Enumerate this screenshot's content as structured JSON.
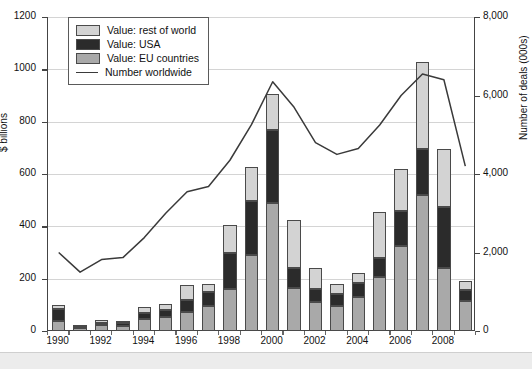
{
  "chart_data": {
    "type": "bar",
    "title": "",
    "subtitle": "",
    "xlabel": "",
    "ylabel": "$ billions",
    "y2label": "Number of deals (000s)",
    "ylim": [
      0,
      1200
    ],
    "y2lim": [
      0,
      8000
    ],
    "yticks": [
      "0",
      "200",
      "400",
      "600",
      "800",
      "1000",
      "1200"
    ],
    "ytick_values": [
      0,
      200,
      400,
      600,
      800,
      1000,
      1200
    ],
    "y2ticks": [
      "0",
      "2,000",
      "4,000",
      "6,000",
      "8,000"
    ],
    "y2tick_values": [
      0,
      2000,
      4000,
      6000,
      8000
    ],
    "grid": true,
    "legend_position": "top-left",
    "stacked": true,
    "categories": [
      "1990",
      "1991",
      "1992",
      "1993",
      "1994",
      "1995",
      "1996",
      "1997",
      "1998",
      "1999",
      "2000",
      "2001",
      "2002",
      "2003",
      "2004",
      "2005",
      "2006",
      "2007",
      "2008",
      "2009"
    ],
    "xtick_labels": [
      "1990",
      "",
      "1992",
      "",
      "1994",
      "",
      "1996",
      "",
      "1998",
      "",
      "2000",
      "",
      "2002",
      "",
      "2004",
      "",
      "2006",
      "",
      "2008",
      ""
    ],
    "series": [
      {
        "name": "Value: EU countries",
        "color": "#a9a9a9",
        "values": [
          38,
          10,
          23,
          20,
          45,
          55,
          72,
          95,
          160,
          290,
          490,
          165,
          110,
          95,
          130,
          205,
          325,
          520,
          240,
          115
        ]
      },
      {
        "name": "Value: USA",
        "color": "#2b2b2b",
        "values": [
          45,
          4,
          8,
          10,
          25,
          25,
          48,
          55,
          140,
          205,
          280,
          75,
          50,
          45,
          55,
          75,
          135,
          175,
          235,
          40
        ]
      },
      {
        "name": "Value: rest of world",
        "color": "#d3d3d3",
        "values": [
          15,
          3,
          13,
          8,
          20,
          25,
          55,
          30,
          105,
          130,
          135,
          185,
          80,
          40,
          35,
          175,
          160,
          335,
          220,
          35
        ]
      }
    ],
    "line_series": {
      "name": "Number worldwide",
      "color": "#3a3a3a",
      "axis": "right",
      "values": [
        2000,
        1500,
        1820,
        1870,
        2380,
        3000,
        3550,
        3680,
        4350,
        5250,
        6350,
        5700,
        4800,
        4500,
        4650,
        5250,
        6000,
        6550,
        6400,
        4200
      ]
    }
  }
}
